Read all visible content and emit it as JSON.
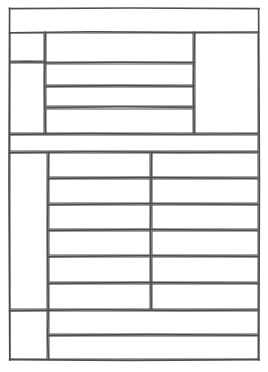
{
  "document": {
    "title": "",
    "kind": "blank-form-grid",
    "page_width": 268,
    "page_height": 372,
    "background_color": "#ffffff",
    "ink_color": "#4f4f4f",
    "ink_color_dark": "#3a3a3a",
    "stroke_width": 1.6,
    "style": "hand-drawn ruled table, no text content"
  },
  "frame": {
    "left": 9,
    "top": 8,
    "right": 259,
    "bottom": 360,
    "label": ""
  },
  "upper_table": {
    "label": "",
    "top": 32,
    "bottom": 134,
    "left": 9,
    "right": 259,
    "col_divider_1_x": 45,
    "col_divider_2_x": 194,
    "left_column": {
      "label": "",
      "row_divider_y": 62,
      "cells": [
        {
          "label": ""
        },
        {
          "label": ""
        }
      ]
    },
    "middle_column": {
      "label": "",
      "row_dividers_y": [
        63,
        86,
        107
      ],
      "cells": [
        {
          "label": ""
        },
        {
          "label": ""
        },
        {
          "label": ""
        },
        {
          "label": ""
        }
      ]
    },
    "right_column": {
      "label": "",
      "cells": [
        {
          "label": ""
        }
      ]
    }
  },
  "middle_band": {
    "label": "",
    "top": 134,
    "bottom": 152,
    "left": 9,
    "right": 259,
    "cells": [
      {
        "label": ""
      }
    ]
  },
  "lower_table": {
    "label": "",
    "top": 152,
    "bottom": 310,
    "left": 9,
    "right": 259,
    "col_divider_1_x": 48,
    "col_divider_2_x": 151,
    "left_column": {
      "label": "",
      "cells": [
        {
          "label": ""
        }
      ]
    },
    "row_dividers_y": [
      178,
      204,
      230,
      256,
      283
    ],
    "rows": [
      {
        "label": "",
        "cells": [
          {
            "label": ""
          },
          {
            "label": ""
          }
        ]
      },
      {
        "label": "",
        "cells": [
          {
            "label": ""
          },
          {
            "label": ""
          }
        ]
      },
      {
        "label": "",
        "cells": [
          {
            "label": ""
          },
          {
            "label": ""
          }
        ]
      },
      {
        "label": "",
        "cells": [
          {
            "label": ""
          },
          {
            "label": ""
          }
        ]
      },
      {
        "label": "",
        "cells": [
          {
            "label": ""
          },
          {
            "label": ""
          }
        ]
      },
      {
        "label": "",
        "cells": [
          {
            "label": ""
          },
          {
            "label": ""
          }
        ]
      }
    ]
  },
  "footer_table": {
    "label": "",
    "top": 310,
    "bottom": 360,
    "left": 9,
    "right": 259,
    "col_divider_x": 48,
    "row_divider_y": 335,
    "left_column": {
      "label": "",
      "cells": [
        {
          "label": ""
        }
      ]
    },
    "rows": [
      {
        "label": "",
        "cells": [
          {
            "label": ""
          }
        ]
      },
      {
        "label": "",
        "cells": [
          {
            "label": ""
          }
        ]
      }
    ]
  }
}
